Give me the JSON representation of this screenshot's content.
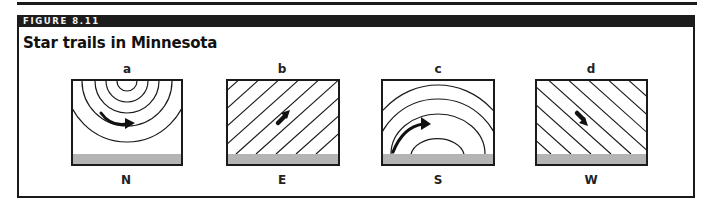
{
  "figure": {
    "number_label": "FIGURE 8.11",
    "title": "Star trails in Minnesota"
  },
  "colors": {
    "ink": "#1a1a1a",
    "header_band": "#1c1c1c",
    "header_text": "#f2f2f2",
    "ground": "#b4b4b4",
    "background": "#ffffff"
  },
  "panels": [
    {
      "letter": "a",
      "direction": "N",
      "pattern": "concentric circles around celestial pole",
      "arrow": "counterclockwise curve to the right"
    },
    {
      "letter": "b",
      "direction": "E",
      "pattern": "diagonal lines rising to the right",
      "arrow": "up-right"
    },
    {
      "letter": "c",
      "direction": "S",
      "pattern": "arcs rising and setting above horizon",
      "arrow": "rising curve to the right"
    },
    {
      "letter": "d",
      "direction": "W",
      "pattern": "diagonal lines descending to the right",
      "arrow": "down-right"
    }
  ]
}
